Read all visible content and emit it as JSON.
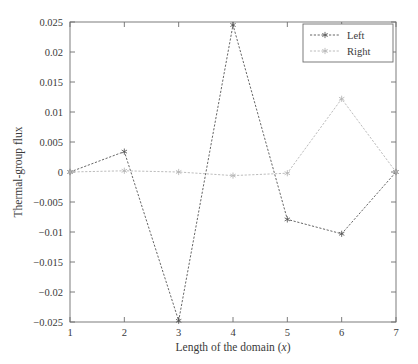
{
  "chart_data": {
    "type": "line",
    "title": "",
    "xlabel": "Length of the domain (x)",
    "xlabel_main": "Length of the domain (",
    "xlabel_italic": "x",
    "xlabel_tail": ")",
    "ylabel": "Thermal-group flux",
    "x": [
      1,
      2,
      3,
      4,
      5,
      6,
      7
    ],
    "xlim": [
      1,
      7
    ],
    "ylim": [
      -0.025,
      0.025
    ],
    "xticks": [
      1,
      2,
      3,
      4,
      5,
      6,
      7
    ],
    "xtick_labels": [
      "1",
      "2",
      "3",
      "4",
      "5",
      "6",
      "7"
    ],
    "yticks": [
      0.025,
      0.02,
      0.015,
      0.01,
      0.005,
      0,
      -0.005,
      -0.01,
      -0.015,
      -0.02,
      -0.025
    ],
    "ytick_labels": [
      "0.025",
      "0.02",
      "0.015",
      "0.01",
      "0.005",
      "0",
      "−0.005",
      "−0.01",
      "−0.015",
      "−0.02",
      "−0.025"
    ],
    "grid": false,
    "legend_position": "upper right",
    "series": [
      {
        "name": "Left",
        "color": "#555555",
        "linestyle": "dashed",
        "marker": "star",
        "values": [
          0,
          0.0034,
          -0.0248,
          0.0245,
          -0.0079,
          -0.0103,
          0
        ]
      },
      {
        "name": "Right",
        "color": "#b4b4b4",
        "linestyle": "dashed",
        "marker": "star",
        "values": [
          0,
          0.0002,
          0.0,
          -0.0006,
          -0.0002,
          0.0122,
          0
        ]
      }
    ]
  },
  "legend": {
    "entries": [
      "Left",
      "Right"
    ]
  },
  "colors": {
    "background": "#ffffff",
    "frame": "#6e6e6e",
    "text": "#3a3a3a",
    "left_series": "#555555",
    "right_series": "#b4b4b4"
  }
}
